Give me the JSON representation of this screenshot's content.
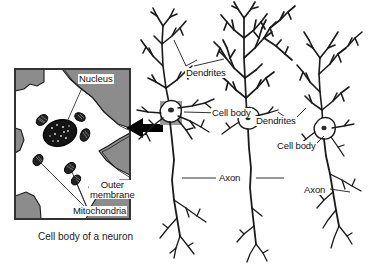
{
  "figure": {
    "title_caption": "Cell body of a neuron",
    "background_color": "#ffffff",
    "ink_color": "#1a1a1a",
    "membrane_gray": "#8c8c8c",
    "cytoplasm_color": "#ffffff",
    "highlight_gray": "#9a9a9a"
  },
  "inset": {
    "name": "cell-body-detail-inset",
    "border_color": "#333333",
    "labels": {
      "nucleus": "Nucleus",
      "outer_membrane_line1": "Outer",
      "outer_membrane_line2": "membrane",
      "mitochondria": "Mitochondria"
    }
  },
  "arrow": {
    "name": "magnify-arrow",
    "direction": "left",
    "color": "#000000"
  },
  "neurons": {
    "labels": {
      "dendrites_left": "Dendrites",
      "cell_body_left": "Cell body",
      "axon_left": "Axon",
      "dendrites_right": "Dendrites",
      "cell_body_right": "Cell body",
      "axon_right": "Axon"
    }
  }
}
